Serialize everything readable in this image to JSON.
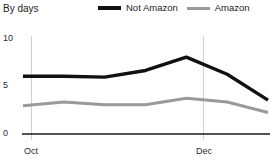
{
  "header": {
    "title": "By days"
  },
  "legend": {
    "position": "top-right",
    "items": [
      {
        "label": "Not Amazon",
        "color": "#111111",
        "icon": "line-swatch-icon"
      },
      {
        "label": "Amazon",
        "color": "#9a9a9a",
        "icon": "line-swatch-icon"
      }
    ]
  },
  "axes": {
    "y_ticks": [
      "0",
      "5",
      "10"
    ],
    "x_ticks": [
      "Oct",
      "Dec"
    ]
  },
  "chart_data": {
    "type": "line",
    "title": "By days",
    "xlabel": "",
    "ylabel": "",
    "ylim": [
      0,
      10
    ],
    "yticks": [
      0,
      5,
      10
    ],
    "grid": "vertical-only",
    "legend_position": "top-right",
    "x": [
      "Oct",
      "Oct-mid",
      "Nov",
      "Nov-mid",
      "Dec",
      "Dec-mid",
      "Jan"
    ],
    "x_tick_labels": [
      "Oct",
      "Dec"
    ],
    "series": [
      {
        "name": "Not Amazon",
        "color": "#111111",
        "values": [
          6.0,
          6.0,
          5.9,
          6.6,
          8.0,
          6.2,
          3.5
        ]
      },
      {
        "name": "Amazon",
        "color": "#9a9a9a",
        "values": [
          2.9,
          3.3,
          3.0,
          3.0,
          3.7,
          3.3,
          2.2
        ]
      }
    ]
  }
}
